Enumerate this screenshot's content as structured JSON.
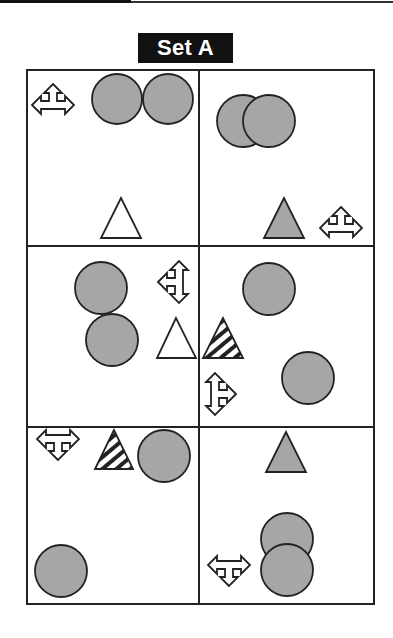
{
  "title": "Set A",
  "colors": {
    "fill_gray": "#a6a6a6",
    "stroke": "#222222",
    "title_bg": "#111111",
    "title_fg": "#ffffff"
  },
  "grid": {
    "rows": 3,
    "cols": 2,
    "cells": [
      {
        "row": 0,
        "col": 0,
        "items": [
          "t-arrow-up-left-right (outline)",
          "gray circle",
          "gray circle",
          "white triangle"
        ]
      },
      {
        "row": 0,
        "col": 1,
        "items": [
          "two overlapping gray circles",
          "gray triangle",
          "t-arrow-up-left-right (outline)"
        ]
      },
      {
        "row": 1,
        "col": 0,
        "items": [
          "gray circle",
          "gray circle",
          "t-arrow-up-down-left (outline)",
          "white triangle"
        ]
      },
      {
        "row": 1,
        "col": 1,
        "items": [
          "gray circle",
          "striped triangle",
          "t-arrow-up-down-right (outline)",
          "gray circle"
        ]
      },
      {
        "row": 2,
        "col": 0,
        "items": [
          "t-arrow-left-right-down (outline)",
          "striped triangle",
          "gray circle",
          "gray circle"
        ]
      },
      {
        "row": 2,
        "col": 1,
        "items": [
          "gray triangle",
          "two overlapping gray circles",
          "t-arrow-left-right-down (outline)"
        ]
      }
    ]
  }
}
